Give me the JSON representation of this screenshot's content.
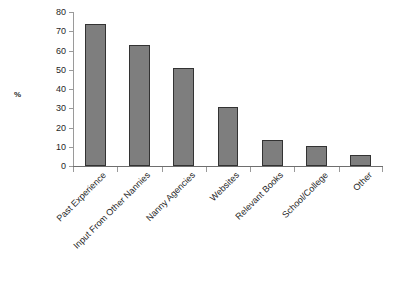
{
  "chart_data": {
    "type": "bar",
    "title": "",
    "xlabel": "",
    "ylabel": "%",
    "ylim": [
      0,
      80
    ],
    "ytick_step": 10,
    "yticks": [
      80,
      70,
      60,
      50,
      40,
      30,
      20,
      10,
      0
    ],
    "grid": false,
    "legend": false,
    "orientation": "vertical",
    "categories": [
      "Past Experience",
      "Input From Other Nannies",
      "Nanny Agencies",
      "Websites",
      "Relevant Books",
      "School/College",
      "Other"
    ],
    "values": [
      74,
      63,
      51,
      30.5,
      13.5,
      10.5,
      5.5
    ],
    "series": [
      {
        "name": "%",
        "values": [
          74,
          63,
          51,
          30.5,
          13.5,
          10.5,
          5.5
        ]
      }
    ],
    "xtick_label_rotation": -45,
    "colors": {
      "bar_fill": "#7e7e7e",
      "bar_border": "#333333",
      "axis": "#6e6e6e",
      "tick": "#9a9a9a",
      "text": "#1f1f1f",
      "background": "#ffffff"
    }
  }
}
